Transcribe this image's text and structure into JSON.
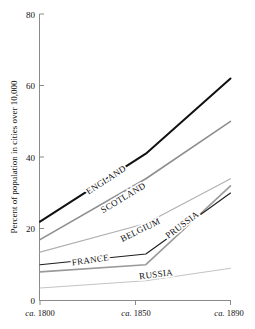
{
  "chart_data": {
    "type": "line",
    "title": "",
    "subtitle": "",
    "xlabel": "",
    "ylabel": "Percent of population in cities over 10,000",
    "x": [
      1800,
      1850,
      1890
    ],
    "xtick_labels": [
      "ca. 1800",
      "ca. 1850",
      "ca. 1890"
    ],
    "ytick_labels": [
      "0",
      "20",
      "40",
      "60",
      "80"
    ],
    "yticks": [
      0,
      20,
      40,
      60,
      80
    ],
    "ylim": [
      0,
      80
    ],
    "xlim": [
      1800,
      1890
    ],
    "grid": false,
    "legend_position": "inline-labels",
    "series": [
      {
        "name": "ENGLAND",
        "values": [
          22,
          41,
          62
        ],
        "color": "#111111",
        "width": 2.0
      },
      {
        "name": "SCOTLAND",
        "values": [
          17,
          34,
          50
        ],
        "color": "#8e8e8e",
        "width": 1.6
      },
      {
        "name": "BELGIUM",
        "values": [
          13.5,
          21.5,
          34
        ],
        "color": "#b0b0b0",
        "width": 1.1
      },
      {
        "name": "PRUSSIA",
        "values": [
          8,
          10,
          32
        ],
        "color": "#9a9a9a",
        "width": 1.6
      },
      {
        "name": "FRANCE",
        "values": [
          10,
          13,
          30
        ],
        "color": "#1d1d1d",
        "width": 1.1
      },
      {
        "name": "RUSSIA",
        "values": [
          3.5,
          5.5,
          9
        ],
        "color": "#c4c4c4",
        "width": 1.1
      }
    ],
    "annotations": [
      {
        "text": "ENGLAND",
        "x": 1832,
        "y": 33,
        "rotation": -33
      },
      {
        "text": "SCOTLAND",
        "x": 1840,
        "y": 28,
        "rotation": -31
      },
      {
        "text": "BELGIUM",
        "x": 1848,
        "y": 19,
        "rotation": -26
      },
      {
        "text": "PRUSSIA",
        "x": 1868,
        "y": 20.5,
        "rotation": -37
      },
      {
        "text": "FRANCE",
        "x": 1824,
        "y": 10.5,
        "rotation": -8
      },
      {
        "text": "RUSSIA",
        "x": 1855,
        "y": 6.5,
        "rotation": -7
      }
    ]
  },
  "axes": {
    "y_title": "Percent of population in cities over 10,000",
    "axis_color": "#808080"
  }
}
